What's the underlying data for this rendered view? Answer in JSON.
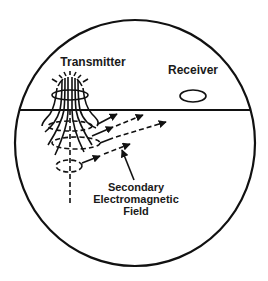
{
  "diagram": {
    "labels": {
      "transmitter": "Transmitter",
      "receiver": "Receiver",
      "secondary_line1": "Secondary",
      "secondary_line2": "Electromagnetic",
      "secondary_line3": "Field"
    },
    "colors": {
      "stroke": "#111111",
      "background": "#ffffff",
      "text": "#1a1a1a"
    }
  }
}
